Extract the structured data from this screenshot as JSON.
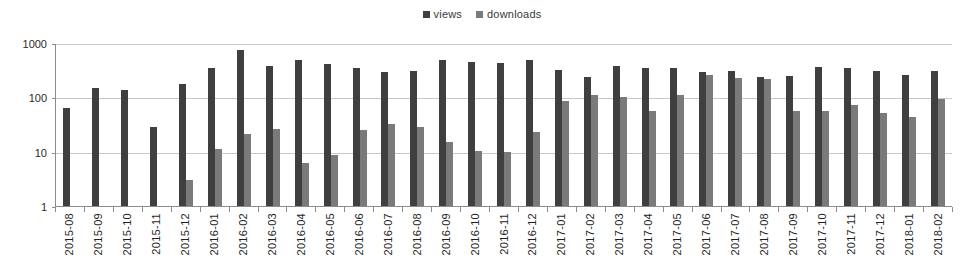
{
  "chart_data": {
    "type": "bar",
    "title": "",
    "subtitle": "",
    "xlabel": "",
    "ylabel": "",
    "yscale": "log",
    "ylim": [
      1,
      1000
    ],
    "yticks": [
      1,
      10,
      100,
      1000
    ],
    "ytick_labels": [
      "1",
      "10",
      "100",
      "1000"
    ],
    "grid": true,
    "legend_position": "top-center",
    "categories": [
      "2015-08",
      "2015-09",
      "2015-10",
      "2015-11",
      "2015-12",
      "2016-01",
      "2016-02",
      "2016-03",
      "2016-04",
      "2016-05",
      "2016-06",
      "2016-07",
      "2016-08",
      "2016-09",
      "2016-10",
      "2016-11",
      "2016-12",
      "2017-01",
      "2017-02",
      "2017-03",
      "2017-04",
      "2017-05",
      "2017-06",
      "2017-07",
      "2017-08",
      "2017-09",
      "2017-10",
      "2017-11",
      "2017-12",
      "2018-01",
      "2018-02"
    ],
    "series": [
      {
        "name": "views",
        "color": "#3f3f3f",
        "values": [
          63,
          150,
          135,
          29,
          175,
          340,
          740,
          380,
          480,
          410,
          340,
          290,
          300,
          490,
          440,
          430,
          480,
          320,
          235,
          370,
          350,
          340,
          290,
          310,
          235,
          250,
          360,
          345,
          310,
          260,
          310
        ]
      },
      {
        "name": "downloads",
        "color": "#7a7a7a",
        "values": [
          0,
          0,
          0,
          0,
          3,
          11,
          21,
          26,
          6.3,
          8.6,
          25,
          33,
          28,
          15,
          10.5,
          10,
          23,
          85,
          110,
          100,
          57,
          110,
          260,
          230,
          215,
          57,
          57,
          73,
          52,
          43,
          95
        ]
      }
    ],
    "legend": [
      {
        "label": "views",
        "color": "#3f3f3f"
      },
      {
        "label": "downloads",
        "color": "#7a7a7a"
      }
    ]
  }
}
